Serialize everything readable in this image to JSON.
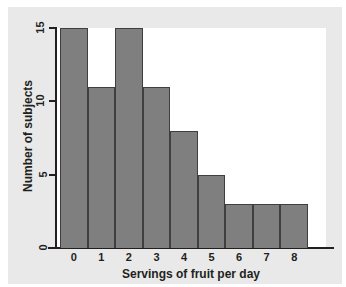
{
  "chart_data": {
    "type": "bar",
    "title": "",
    "xlabel": "Servings of fruit per day",
    "ylabel": "Number of subjects",
    "categories": [
      "0",
      "1",
      "2",
      "3",
      "4",
      "5",
      "6",
      "7",
      "8"
    ],
    "values": [
      15,
      11,
      15,
      11,
      8,
      5,
      3,
      3,
      3
    ],
    "ylim": [
      0,
      15
    ],
    "yticks": [
      0,
      5,
      10,
      15
    ],
    "ytick_labels": [
      "0",
      "5",
      "10",
      "15"
    ],
    "xtick_labels": [
      "0",
      "1",
      "2",
      "3",
      "4",
      "5",
      "6",
      "7",
      "8"
    ],
    "grid": false,
    "legend": false,
    "bar_color": "#7f7f7f",
    "bar_edge_color": "#3f3f3f",
    "axis_color": "#231f20",
    "plot_background": "#ffffff",
    "figure_background": "#e9e9e9"
  }
}
